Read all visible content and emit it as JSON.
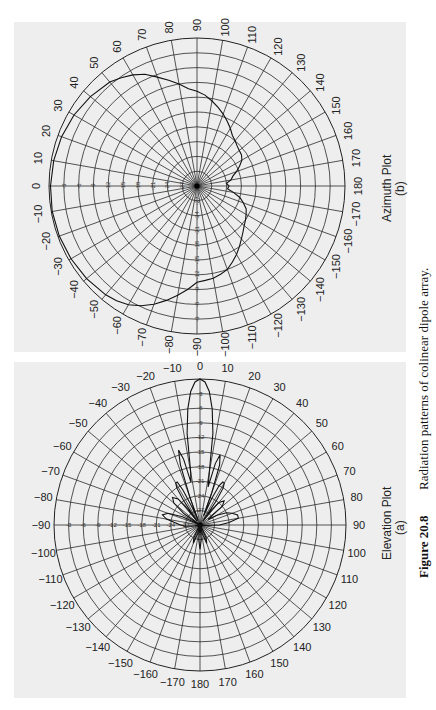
{
  "caption": {
    "label": "Figure 20.8",
    "text": "Radiation patterns of colinear dipole array."
  },
  "colors": {
    "panel": "#eeeeee",
    "grid": "#2a2a2a",
    "pattern": "#111111"
  },
  "chart_data": [
    {
      "type": "polar-line",
      "title": "Azimuth Plot",
      "sublabel": "(b)",
      "angle_unit": "degrees",
      "angle_ticks": [
        0,
        10,
        20,
        30,
        40,
        50,
        60,
        70,
        80,
        90,
        100,
        110,
        120,
        130,
        140,
        150,
        160,
        170,
        180,
        -170,
        -160,
        -150,
        -140,
        -130,
        -120,
        -110,
        -100,
        -90,
        -80,
        -70,
        -60,
        -50,
        -40,
        -30,
        -20,
        -10
      ],
      "radial_ticks_db": [
        -3,
        -6,
        -9,
        -12,
        -15,
        -18,
        -21,
        -24,
        -27
      ],
      "radial_range_db": [
        -30,
        0
      ],
      "orientation": "0° at left, 90° at top, 180° at right, -90° at bottom",
      "series": [
        {
          "name": "Azimuth pattern",
          "angles": [
            0,
            10,
            20,
            30,
            40,
            50,
            55,
            60,
            65,
            70,
            75,
            80,
            85,
            90,
            95,
            100,
            105,
            110,
            115,
            120,
            125,
            130,
            135,
            140,
            145,
            150,
            155,
            160,
            165,
            170,
            175,
            180,
            -175,
            -170,
            -165,
            -160,
            -155,
            -150,
            -145,
            -140,
            -135,
            -130,
            -125,
            -120,
            -115,
            -110,
            -105,
            -100,
            -95,
            -90,
            -85,
            -80,
            -75,
            -70,
            -65,
            -60,
            -55,
            -50,
            -40,
            -30,
            -20,
            -10
          ],
          "values_db": [
            -0.3,
            -0.5,
            -0.8,
            -1.2,
            -1.8,
            -2.5,
            -3.2,
            -4.0,
            -5.0,
            -6.5,
            -7.8,
            -9.0,
            -10.2,
            -10.8,
            -11.5,
            -12.5,
            -13.5,
            -14.5,
            -15.5,
            -16.5,
            -17.5,
            -18.0,
            -18.5,
            -18.8,
            -19.0,
            -19.5,
            -20.5,
            -21.5,
            -22.5,
            -23.0,
            -24.0,
            -23.5,
            -23.8,
            -22.5,
            -21.0,
            -20.0,
            -19.0,
            -18.5,
            -18.0,
            -17.5,
            -16.8,
            -16.0,
            -15.0,
            -14.0,
            -13.0,
            -12.0,
            -11.5,
            -11.0,
            -10.8,
            -10.5,
            -9.0,
            -7.5,
            -6.0,
            -4.5,
            -3.2,
            -2.2,
            -1.6,
            -1.2,
            -0.8,
            -0.5,
            -0.3,
            -0.2
          ]
        }
      ]
    },
    {
      "type": "polar-line",
      "title": "Elevation Plot",
      "sublabel": "(a)",
      "angle_unit": "degrees",
      "angle_ticks": [
        0,
        10,
        20,
        30,
        40,
        50,
        60,
        70,
        80,
        90,
        100,
        110,
        120,
        130,
        140,
        150,
        160,
        170,
        180,
        -170,
        -160,
        -150,
        -140,
        -130,
        -120,
        -110,
        -100,
        -90,
        -80,
        -70,
        -60,
        -50,
        -40,
        -30,
        -20,
        -10
      ],
      "radial_ticks_db": [
        -3,
        -6,
        -9,
        -12,
        -15,
        -18,
        -21,
        -24,
        -27
      ],
      "radial_range_db": [
        -30,
        0
      ],
      "orientation": "0° at top, 90° at right, 180° at bottom, -90° at left",
      "series": [
        {
          "name": "Elevation pattern",
          "angles": [
            0,
            2,
            4,
            6,
            8,
            10,
            12,
            14,
            16,
            18,
            20,
            22,
            24,
            26,
            28,
            30,
            32,
            34,
            36,
            38,
            40,
            45,
            50,
            55,
            60,
            65,
            70,
            75,
            80,
            85,
            90,
            95,
            100,
            110,
            120,
            130,
            140,
            150,
            155,
            160,
            165,
            170,
            175,
            180,
            -175,
            -170,
            -165,
            -160,
            -155,
            -150,
            -140,
            -130,
            -120,
            -110,
            -100,
            -95,
            -90,
            -85,
            -80,
            -75,
            -70,
            -65,
            -60,
            -55,
            -50,
            -45,
            -40,
            -38,
            -36,
            -34,
            -32,
            -30,
            -28,
            -26,
            -24,
            -22,
            -20,
            -18,
            -16,
            -14,
            -12,
            -10,
            -8,
            -6,
            -4,
            -2
          ],
          "values_db": [
            0,
            -0.6,
            -2.5,
            -6,
            -11,
            -19,
            -22,
            -17,
            -15,
            -17,
            -23,
            -28,
            -24,
            -21,
            -20,
            -20,
            -21,
            -24,
            -29,
            -26,
            -24,
            -23,
            -24,
            -28,
            -26,
            -24,
            -23,
            -22,
            -22,
            -24,
            -26,
            -29,
            -30,
            -30,
            -30,
            -30,
            -30,
            -29,
            -27,
            -26,
            -28,
            -30,
            -27,
            -25,
            -27,
            -30,
            -28,
            -26,
            -27,
            -29,
            -30,
            -30,
            -30,
            -30,
            -29,
            -27,
            -26,
            -25,
            -23,
            -22,
            -23,
            -26,
            -30,
            -26,
            -23,
            -22,
            -23,
            -25,
            -29,
            -24,
            -21,
            -20,
            -20,
            -22,
            -26,
            -29,
            -24,
            -17,
            -14,
            -16,
            -21,
            -19,
            -11,
            -6,
            -2.5,
            -0.6
          ]
        }
      ]
    }
  ]
}
